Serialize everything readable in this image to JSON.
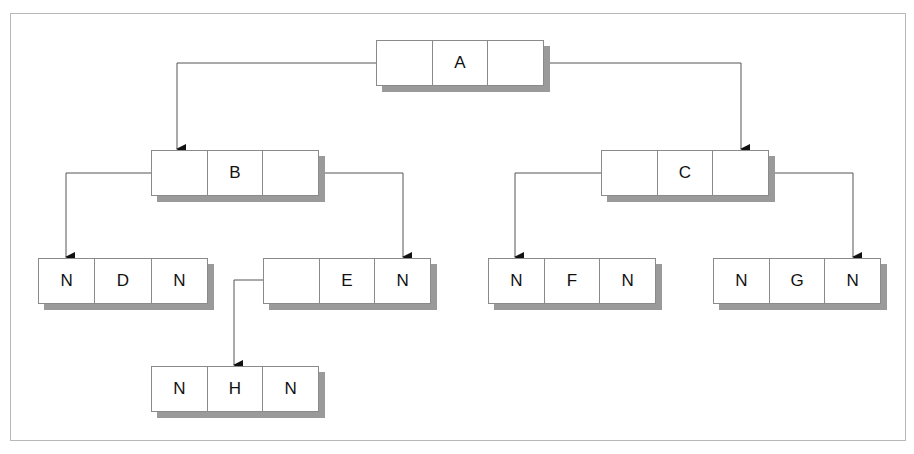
{
  "diagram": {
    "type": "binary-tree-linked-representation",
    "nodes": [
      {
        "id": "A",
        "cells": [
          "",
          "A",
          ""
        ],
        "x": 376,
        "y": 40,
        "w": 168
      },
      {
        "id": "B",
        "cells": [
          "",
          "B",
          ""
        ],
        "x": 151,
        "y": 150,
        "w": 168
      },
      {
        "id": "C",
        "cells": [
          "",
          "C",
          ""
        ],
        "x": 601,
        "y": 150,
        "w": 168
      },
      {
        "id": "D",
        "cells": [
          "N",
          "D",
          "N"
        ],
        "x": 38,
        "y": 258,
        "w": 170
      },
      {
        "id": "E",
        "cells": [
          "",
          "E",
          "N"
        ],
        "x": 263,
        "y": 258,
        "w": 168
      },
      {
        "id": "F",
        "cells": [
          "N",
          "F",
          "N"
        ],
        "x": 488,
        "y": 258,
        "w": 168
      },
      {
        "id": "G",
        "cells": [
          "N",
          "G",
          "N"
        ],
        "x": 713,
        "y": 258,
        "w": 168
      },
      {
        "id": "H",
        "cells": [
          "N",
          "H",
          "N"
        ],
        "x": 151,
        "y": 366,
        "w": 168
      }
    ],
    "edges": [
      {
        "from": "A",
        "side": "left",
        "to": "B"
      },
      {
        "from": "A",
        "side": "right",
        "to": "C"
      },
      {
        "from": "B",
        "side": "left",
        "to": "D"
      },
      {
        "from": "B",
        "side": "right",
        "to": "E"
      },
      {
        "from": "C",
        "side": "left",
        "to": "F"
      },
      {
        "from": "C",
        "side": "right",
        "to": "G"
      },
      {
        "from": "E",
        "side": "left",
        "to": "H"
      }
    ],
    "null_label": "N"
  }
}
